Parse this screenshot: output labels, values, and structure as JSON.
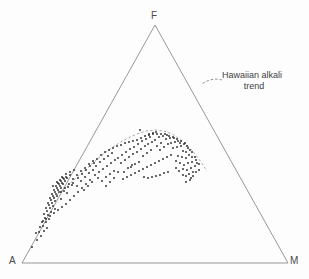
{
  "figure": {
    "type": "ternary-scatter",
    "background_color": "#fdfdfd",
    "line_color": "#8c8c8c",
    "point_color": "#2b2b2b",
    "text_color": "#4a4a4a"
  },
  "apices": {
    "top": "F",
    "bottom_left": "A",
    "bottom_right": "M"
  },
  "annotation": {
    "line1": "Hawaiian alkali",
    "line2": "trend"
  },
  "chart_data": {
    "type": "scatter",
    "title": "",
    "xlabel": "",
    "ylabel": "",
    "projection": "ternary",
    "axis_labels": [
      "A",
      "F",
      "M"
    ],
    "grid": false,
    "legend": [
      "Hawaiian alkali trend"
    ],
    "annotations": [
      {
        "text": "Hawaiian alkali trend",
        "x": 230,
        "y": 78,
        "leader_from": [
          222,
          80
        ],
        "leader_to": [
          202,
          84
        ]
      }
    ],
    "triangle": {
      "apex_top": [
        155,
        25
      ],
      "apex_left": [
        22,
        263
      ],
      "apex_right": [
        288,
        263
      ]
    },
    "trend_line": {
      "name": "Hawaiian alkali trend",
      "style": "dashed",
      "points": [
        [
          50,
          201
        ],
        [
          58,
          194
        ],
        [
          66,
          187
        ],
        [
          75,
          179
        ],
        [
          84,
          171
        ],
        [
          93,
          163
        ],
        [
          101,
          156
        ],
        [
          110,
          149
        ],
        [
          119,
          143
        ],
        [
          128,
          138
        ],
        [
          137,
          134
        ],
        [
          146,
          131
        ],
        [
          155,
          130
        ],
        [
          164,
          131
        ],
        [
          172,
          134
        ],
        [
          180,
          139
        ],
        [
          188,
          146
        ],
        [
          195,
          154
        ],
        [
          201,
          162
        ],
        [
          207,
          171
        ]
      ]
    },
    "points": [
      [
        37,
        240
      ],
      [
        32,
        247
      ],
      [
        44,
        231
      ],
      [
        41,
        236
      ],
      [
        47,
        228
      ],
      [
        39,
        232
      ],
      [
        43,
        226
      ],
      [
        46,
        222
      ],
      [
        49,
        219
      ],
      [
        42,
        222
      ],
      [
        45,
        218
      ],
      [
        48,
        215
      ],
      [
        51,
        212
      ],
      [
        44,
        214
      ],
      [
        47,
        211
      ],
      [
        50,
        208
      ],
      [
        53,
        206
      ],
      [
        46,
        208
      ],
      [
        49,
        205
      ],
      [
        52,
        203
      ],
      [
        55,
        201
      ],
      [
        48,
        203
      ],
      [
        51,
        200
      ],
      [
        54,
        198
      ],
      [
        57,
        196
      ],
      [
        50,
        198
      ],
      [
        53,
        196
      ],
      [
        56,
        194
      ],
      [
        59,
        192
      ],
      [
        52,
        194
      ],
      [
        55,
        192
      ],
      [
        58,
        190
      ],
      [
        61,
        188
      ],
      [
        54,
        190
      ],
      [
        57,
        188
      ],
      [
        60,
        186
      ],
      [
        63,
        184
      ],
      [
        56,
        186
      ],
      [
        59,
        184
      ],
      [
        62,
        183
      ],
      [
        65,
        181
      ],
      [
        58,
        183
      ],
      [
        61,
        181
      ],
      [
        64,
        179
      ],
      [
        67,
        178
      ],
      [
        60,
        180
      ],
      [
        63,
        178
      ],
      [
        66,
        177
      ],
      [
        70,
        175
      ],
      [
        62,
        177
      ],
      [
        66,
        174
      ],
      [
        70,
        172
      ],
      [
        74,
        170
      ],
      [
        64,
        191
      ],
      [
        68,
        187
      ],
      [
        72,
        185
      ],
      [
        55,
        209
      ],
      [
        61,
        199
      ],
      [
        67,
        193
      ],
      [
        73,
        183
      ],
      [
        78,
        178
      ],
      [
        82,
        174
      ],
      [
        86,
        170
      ],
      [
        90,
        166
      ],
      [
        94,
        163
      ],
      [
        77,
        186
      ],
      [
        81,
        181
      ],
      [
        85,
        177
      ],
      [
        89,
        173
      ],
      [
        93,
        170
      ],
      [
        84,
        190
      ],
      [
        88,
        186
      ],
      [
        92,
        182
      ],
      [
        96,
        166
      ],
      [
        100,
        162
      ],
      [
        104,
        159
      ],
      [
        108,
        156
      ],
      [
        112,
        153
      ],
      [
        99,
        172
      ],
      [
        103,
        169
      ],
      [
        107,
        166
      ],
      [
        111,
        163
      ],
      [
        115,
        160
      ],
      [
        106,
        177
      ],
      [
        110,
        174
      ],
      [
        114,
        171
      ],
      [
        118,
        158
      ],
      [
        122,
        155
      ],
      [
        126,
        152
      ],
      [
        130,
        149
      ],
      [
        121,
        163
      ],
      [
        125,
        160
      ],
      [
        129,
        157
      ],
      [
        133,
        154
      ],
      [
        124,
        172
      ],
      [
        128,
        168
      ],
      [
        132,
        165
      ],
      [
        134,
        147
      ],
      [
        138,
        144
      ],
      [
        142,
        141
      ],
      [
        137,
        152
      ],
      [
        141,
        149
      ],
      [
        145,
        146
      ],
      [
        146,
        139
      ],
      [
        150,
        137
      ],
      [
        143,
        156
      ],
      [
        147,
        153
      ],
      [
        151,
        150
      ],
      [
        140,
        130
      ],
      [
        148,
        144
      ],
      [
        152,
        142
      ],
      [
        155,
        140
      ],
      [
        149,
        135
      ],
      [
        153,
        133
      ],
      [
        156,
        132
      ],
      [
        157,
        146
      ],
      [
        161,
        143
      ],
      [
        159,
        137
      ],
      [
        163,
        136
      ],
      [
        167,
        135
      ],
      [
        160,
        150
      ],
      [
        164,
        147
      ],
      [
        168,
        144
      ],
      [
        166,
        139
      ],
      [
        170,
        138
      ],
      [
        174,
        138
      ],
      [
        171,
        143
      ],
      [
        175,
        142
      ],
      [
        178,
        141
      ],
      [
        173,
        148
      ],
      [
        177,
        147
      ],
      [
        181,
        146
      ],
      [
        180,
        143
      ],
      [
        184,
        144
      ],
      [
        187,
        146
      ],
      [
        183,
        151
      ],
      [
        186,
        152
      ],
      [
        190,
        150
      ],
      [
        189,
        155
      ],
      [
        192,
        157
      ],
      [
        186,
        158
      ],
      [
        182,
        157
      ],
      [
        178,
        156
      ],
      [
        176,
        161
      ],
      [
        180,
        163
      ],
      [
        184,
        165
      ],
      [
        188,
        163
      ],
      [
        192,
        162
      ],
      [
        196,
        160
      ],
      [
        191,
        168
      ],
      [
        187,
        170
      ],
      [
        183,
        169
      ],
      [
        179,
        171
      ],
      [
        176,
        168
      ],
      [
        195,
        166
      ],
      [
        199,
        164
      ],
      [
        193,
        172
      ],
      [
        189,
        174
      ],
      [
        186,
        176
      ],
      [
        183,
        175
      ],
      [
        171,
        155
      ],
      [
        167,
        157
      ],
      [
        163,
        159
      ],
      [
        159,
        161
      ],
      [
        155,
        163
      ],
      [
        151,
        165
      ],
      [
        147,
        167
      ],
      [
        143,
        169
      ],
      [
        139,
        171
      ],
      [
        135,
        173
      ],
      [
        131,
        175
      ],
      [
        127,
        177
      ],
      [
        123,
        179
      ],
      [
        144,
        177
      ],
      [
        148,
        178
      ],
      [
        152,
        177
      ],
      [
        156,
        176
      ],
      [
        160,
        175
      ],
      [
        164,
        173
      ],
      [
        168,
        172
      ],
      [
        131,
        167
      ],
      [
        135,
        164
      ],
      [
        139,
        162
      ],
      [
        118,
        172
      ],
      [
        114,
        178
      ],
      [
        110,
        182
      ],
      [
        106,
        186
      ],
      [
        102,
        181
      ],
      [
        98,
        178
      ],
      [
        95,
        175
      ],
      [
        90,
        180
      ],
      [
        86,
        184
      ],
      [
        82,
        188
      ],
      [
        78,
        192
      ],
      [
        74,
        196
      ],
      [
        70,
        200
      ],
      [
        66,
        204
      ],
      [
        62,
        207
      ],
      [
        58,
        210
      ],
      [
        54,
        213
      ],
      [
        50,
        216
      ],
      [
        46,
        219
      ],
      [
        43,
        221
      ],
      [
        40,
        227
      ],
      [
        36,
        233
      ],
      [
        53,
        186
      ],
      [
        57,
        182
      ],
      [
        61,
        192
      ],
      [
        65,
        188
      ],
      [
        69,
        184
      ],
      [
        73,
        179
      ],
      [
        77,
        175
      ],
      [
        81,
        171
      ],
      [
        85,
        168
      ],
      [
        89,
        164
      ],
      [
        93,
        161
      ],
      [
        97,
        159
      ],
      [
        101,
        155
      ],
      [
        105,
        152
      ],
      [
        109,
        150
      ],
      [
        113,
        148
      ],
      [
        117,
        146
      ],
      [
        121,
        145
      ],
      [
        125,
        143
      ],
      [
        129,
        142
      ],
      [
        133,
        141
      ],
      [
        137,
        140
      ],
      [
        141,
        138
      ],
      [
        145,
        136
      ],
      [
        149,
        134
      ],
      [
        153,
        134
      ],
      [
        157,
        134
      ],
      [
        161,
        134
      ],
      [
        165,
        134
      ],
      [
        169,
        136
      ],
      [
        173,
        137
      ],
      [
        177,
        139
      ],
      [
        181,
        141
      ],
      [
        185,
        143
      ],
      [
        188,
        148
      ],
      [
        192,
        152
      ],
      [
        195,
        157
      ],
      [
        197,
        163
      ],
      [
        199,
        170
      ],
      [
        191,
        178
      ],
      [
        186,
        182
      ],
      [
        193,
        176
      ],
      [
        190,
        180
      ],
      [
        196,
        172
      ]
    ]
  }
}
